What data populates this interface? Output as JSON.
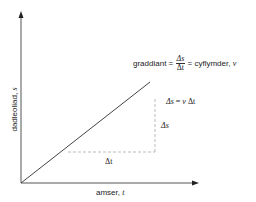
{
  "diagram": {
    "type": "displacement-time graph",
    "x_axis": {
      "label": "amser,",
      "symbol": "t"
    },
    "y_axis": {
      "label": "dadleoliad,",
      "symbol": "s"
    },
    "gradient_label": {
      "prefix": "graddiant =",
      "numerator": "Δs",
      "denominator": "Δt",
      "suffix": "= cyflymder,",
      "symbol": "v"
    },
    "delta_s_equation": {
      "lhs": "Δs",
      "eq": "=",
      "v": "v",
      "dt": "Δt"
    },
    "delta_s_label": "Δs",
    "delta_t_label": "Δt",
    "colors": {
      "axis": "#555555",
      "line": "#444444",
      "dash": "#aaaaaa",
      "text": "#222222"
    }
  }
}
